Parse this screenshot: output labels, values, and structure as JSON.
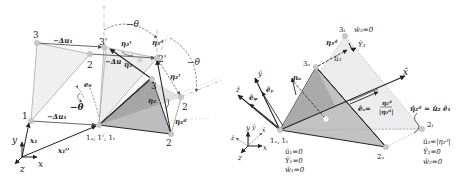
{
  "colors": {
    "line_dark": "#222222",
    "line_grey": "#9a9a9a",
    "fill_light": "#ececec",
    "fill_mid": "#d8d8d8",
    "fill_dark": "#a8a8a8",
    "node": "#c8c8c8"
  },
  "left_panel": {
    "node_labels": {
      "n1": "1",
      "n2": "2",
      "n3": "3",
      "n3p": "3'",
      "n2p": "2'",
      "n3o": "3",
      "n2t": "2",
      "n2o": "2",
      "n1o": "1",
      "n1o_full": "1ₒ, 1', 1ₜ"
    },
    "labels": {
      "du_top": "−Δu₁",
      "du_mid": "−Δu",
      "du_bot": "−Δu₁",
      "theta_top": "−θ",
      "theta_right": "−θ",
      "theta_left": "−θ",
      "theta_mid": "−θ",
      "e0": "e₀",
      "eta3t": "η₃ᵗ",
      "eta3d": "η₃ᵈ",
      "eta3": "η₃",
      "eta2t": "η₂ᵗ",
      "eta2": "η₂",
      "eta2d": "η₂ᵈ",
      "x1": "x₁",
      "x1o": "x₁ᴼ"
    },
    "axes": {
      "x": "x",
      "y": "y",
      "z": "z"
    }
  },
  "right_panel": {
    "node_labels": {
      "n3t": "3ₜ",
      "n3o": "3ₒ",
      "n2t": "2ₜ",
      "n2o": "2ₒ",
      "n1o": "1ₒ, 1ₜ"
    },
    "labels": {
      "w3": "ŵ₃=0",
      "v3": "Ŷ₃",
      "u3": "û₃",
      "eta3d": "η₃ᵈ",
      "no": "nₒ",
      "xhat": "x̂",
      "yhat": "ŷ",
      "zhat": "ẑ",
      "ey": "êᵧ",
      "ez": "êᵩ",
      "ex_lhs": "êₓ=",
      "ex_num": "η₂ᵈ",
      "ex_den": "|η₂ᵈ|",
      "eta2d_eq": "η̂₂ᵈ = û₂ ê₁"
    },
    "bc_node1": [
      "û₁=0",
      "Ŷ₁=0",
      "ŵ₁=0"
    ],
    "bc_node2": [
      "û₂=|η₂ᵈ|",
      "Ŷ₂=0",
      "ŵ₂=0"
    ],
    "axes": {
      "x": "x",
      "y": "y",
      "z": "z",
      "xhat": "x̂",
      "yhat": "ŷ",
      "zhat": "ẑ"
    }
  }
}
